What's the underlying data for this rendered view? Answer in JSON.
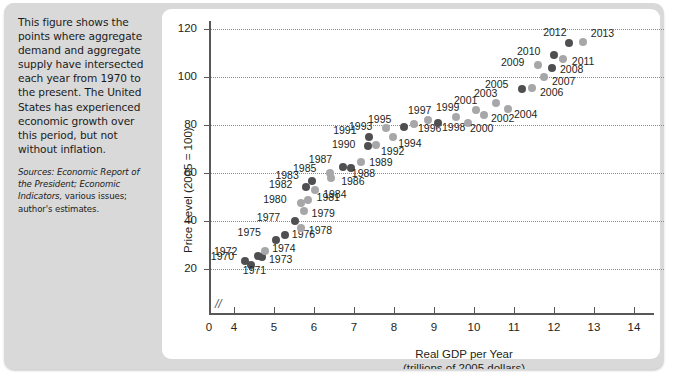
{
  "caption": {
    "body": "This figure shows the points where aggregate demand and aggregate supply have intersected each year from 1970 to the present. The United States has experienced economic growth over this period, but not without inflation.",
    "sources_italic": "Sources: Economic Report of the President; Economic Indicators,",
    "sources_rest": "various issues; author's estimates."
  },
  "chart_data": {
    "type": "scatter",
    "title": "",
    "xlabel": "Real GDP per Year",
    "xlabel_sub": "(trillions of 2005 dollars)",
    "ylabel": "Price Level (2005 = 100)",
    "xlim": [
      3.45,
      14.55
    ],
    "ylim": [
      0,
      128
    ],
    "xticks": [
      0,
      4,
      5,
      6,
      7,
      8,
      9,
      10,
      11,
      12,
      13,
      14
    ],
    "yticks": [
      20,
      40,
      60,
      80,
      100,
      120
    ],
    "grid": "horizontal-dotted",
    "axis_break": true,
    "legend": "none",
    "point_color_dark": "#4f4f52",
    "point_color_light": "#a7a7aa",
    "points": [
      {
        "label": "1970",
        "x": 4.27,
        "y": 23.5,
        "shade": "dark",
        "lx": -34,
        "ly": -5
      },
      {
        "label": "1971",
        "x": 4.42,
        "y": 21.6,
        "shade": "dark",
        "lx": -8,
        "ly": 5
      },
      {
        "label": "1972",
        "x": 4.6,
        "y": 25.5,
        "shade": "dark",
        "lx": -44,
        "ly": -5
      },
      {
        "label": "1973",
        "x": 4.7,
        "y": 24.8,
        "shade": "dark",
        "lx": 7,
        "ly": 2
      },
      {
        "label": "1974",
        "x": 4.78,
        "y": 27.6,
        "shade": "light",
        "lx": 7,
        "ly": -3
      },
      {
        "label": "1975",
        "x": 5.04,
        "y": 31.9,
        "shade": "dark",
        "lx": -38,
        "ly": -8
      },
      {
        "label": "1976",
        "x": 5.27,
        "y": 34.2,
        "shade": "dark",
        "lx": 7,
        "ly": -1
      },
      {
        "label": "1977",
        "x": 5.52,
        "y": 39.9,
        "shade": "dark",
        "lx": -38,
        "ly": -4
      },
      {
        "label": "1978",
        "x": 5.67,
        "y": 37.2,
        "shade": "light",
        "lx": 8,
        "ly": 2
      },
      {
        "label": "1979",
        "x": 5.74,
        "y": 44.3,
        "shade": "light",
        "lx": 8,
        "ly": 2
      },
      {
        "label": "1980",
        "x": 5.68,
        "y": 47.4,
        "shade": "light",
        "lx": -38,
        "ly": -4
      },
      {
        "label": "1981",
        "x": 5.84,
        "y": 48.6,
        "shade": "light",
        "lx": 9,
        "ly": -3
      },
      {
        "label": "1982",
        "x": 5.8,
        "y": 54.1,
        "shade": "dark",
        "lx": -37,
        "ly": -3
      },
      {
        "label": "1983",
        "x": 5.96,
        "y": 56.5,
        "shade": "dark",
        "lx": -37,
        "ly": -6
      },
      {
        "label": "1984",
        "x": 6.03,
        "y": 52.8,
        "shade": "light",
        "lx": 8,
        "ly": 4
      },
      {
        "label": "1985",
        "x": 6.4,
        "y": 60.2,
        "shade": "light",
        "lx": -37,
        "ly": -5
      },
      {
        "label": "1986",
        "x": 6.43,
        "y": 58.1,
        "shade": "light",
        "lx": 10,
        "ly": 3
      },
      {
        "label": "1987",
        "x": 6.72,
        "y": 62.6,
        "shade": "dark",
        "lx": -34,
        "ly": -8
      },
      {
        "label": "1988",
        "x": 6.92,
        "y": 61.9,
        "shade": "dark",
        "lx": 1,
        "ly": 5
      },
      {
        "label": "1989",
        "x": 7.18,
        "y": 64.6,
        "shade": "light",
        "lx": 8,
        "ly": 0
      },
      {
        "label": "1990",
        "x": 7.35,
        "y": 71.4,
        "shade": "dark",
        "lx": -36,
        "ly": -2
      },
      {
        "label": "1991",
        "x": 7.38,
        "y": 74.8,
        "shade": "dark",
        "lx": -36,
        "ly": -7
      },
      {
        "label": "1992",
        "x": 7.55,
        "y": 71.6,
        "shade": "light",
        "lx": 5,
        "ly": 6
      },
      {
        "label": "1993",
        "x": 7.8,
        "y": 78.7,
        "shade": "light",
        "lx": -37,
        "ly": -2
      },
      {
        "label": "1994",
        "x": 7.98,
        "y": 75.2,
        "shade": "light",
        "lx": 5,
        "ly": 6
      },
      {
        "label": "1995",
        "x": 8.25,
        "y": 79.1,
        "shade": "dark",
        "lx": -36,
        "ly": -8
      },
      {
        "label": "1996",
        "x": 8.5,
        "y": 80.5,
        "shade": "light",
        "lx": 4,
        "ly": 4
      },
      {
        "label": "1997",
        "x": 8.85,
        "y": 82.2,
        "shade": "light",
        "lx": -20,
        "ly": -10
      },
      {
        "label": "1998",
        "x": 9.1,
        "y": 80.9,
        "shade": "dark",
        "lx": 4,
        "ly": 4
      },
      {
        "label": "1999",
        "x": 9.55,
        "y": 83.4,
        "shade": "light",
        "lx": -20,
        "ly": -10
      },
      {
        "label": "2000",
        "x": 9.85,
        "y": 80.9,
        "shade": "light",
        "lx": 2,
        "ly": 5
      },
      {
        "label": "2001",
        "x": 10.05,
        "y": 86.4,
        "shade": "light",
        "lx": -22,
        "ly": -10
      },
      {
        "label": "2002",
        "x": 10.25,
        "y": 84.1,
        "shade": "light",
        "lx": 7,
        "ly": 3
      },
      {
        "label": "2003",
        "x": 10.55,
        "y": 89.1,
        "shade": "light",
        "lx": -22,
        "ly": -10
      },
      {
        "label": "2004",
        "x": 10.85,
        "y": 86.8,
        "shade": "light",
        "lx": 6,
        "ly": 5
      },
      {
        "label": "2005",
        "x": 11.2,
        "y": 95.1,
        "shade": "dark",
        "lx": -37,
        "ly": -5
      },
      {
        "label": "2006",
        "x": 11.45,
        "y": 95.6,
        "shade": "light",
        "lx": 8,
        "ly": 4
      },
      {
        "label": "2007",
        "x": 11.75,
        "y": 100.0,
        "shade": "light",
        "lx": 8,
        "ly": 4
      },
      {
        "label": "2008",
        "x": 11.95,
        "y": 103.6,
        "shade": "dark",
        "lx": 8,
        "ly": 1
      },
      {
        "label": "2009",
        "x": 11.6,
        "y": 104.9,
        "shade": "light",
        "lx": -37,
        "ly": -3
      },
      {
        "label": "2010",
        "x": 12.0,
        "y": 109.2,
        "shade": "dark",
        "lx": -37,
        "ly": -4
      },
      {
        "label": "2011",
        "x": 12.22,
        "y": 107.3,
        "shade": "light",
        "lx": 9,
        "ly": 2
      },
      {
        "label": "2012",
        "x": 12.38,
        "y": 114.0,
        "shade": "dark",
        "lx": -26,
        "ly": -11
      },
      {
        "label": "2013",
        "x": 12.72,
        "y": 114.5,
        "shade": "light",
        "lx": 8,
        "ly": -9
      }
    ]
  }
}
